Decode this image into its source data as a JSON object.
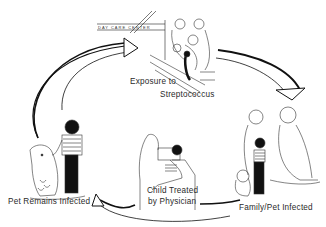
{
  "diagram": {
    "title": "",
    "sign_text": "DAY CARE CENTER",
    "stages": [
      {
        "id": "exposure",
        "line1": "Exposure to",
        "line2": "Streptococcus"
      },
      {
        "id": "family",
        "line1": "Family/Pet Infected"
      },
      {
        "id": "treated",
        "line1": "Child Treated",
        "line2": "by Physician"
      },
      {
        "id": "pet",
        "line1": "Pet Remains Infected"
      }
    ],
    "flow": [
      "exposure",
      "family",
      "treated",
      "pet",
      "exposure"
    ]
  }
}
